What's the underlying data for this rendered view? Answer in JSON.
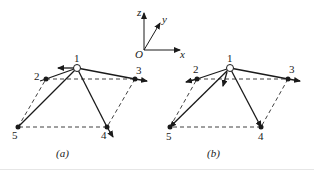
{
  "axes": {
    "origin_label": "O",
    "x_label": "x",
    "y_label": "y",
    "z_label": "z"
  },
  "figure_a": {
    "caption": "(a)",
    "nodes": [
      {
        "id": "1",
        "label": "1",
        "type": "open"
      },
      {
        "id": "2",
        "label": "2",
        "type": "filled"
      },
      {
        "id": "3",
        "label": "3",
        "type": "filled"
      },
      {
        "id": "4",
        "label": "4",
        "type": "filled"
      },
      {
        "id": "5",
        "label": "5",
        "type": "filled"
      }
    ],
    "members": [
      "1-2",
      "1-3",
      "1-4",
      "1-5"
    ],
    "dashed_outline": [
      "2-3",
      "3-4",
      "4-5",
      "5-2"
    ]
  },
  "figure_b": {
    "caption": "(b)",
    "nodes": [
      {
        "id": "1",
        "label": "1",
        "type": "open"
      },
      {
        "id": "2",
        "label": "2",
        "type": "filled"
      },
      {
        "id": "3",
        "label": "3",
        "type": "filled"
      },
      {
        "id": "4",
        "label": "4",
        "type": "filled"
      },
      {
        "id": "5",
        "label": "5",
        "type": "filled"
      }
    ],
    "members": [
      "1-2",
      "1-3",
      "1-4",
      "1-5"
    ],
    "dashed_outline": [
      "2-3",
      "3-4",
      "4-5",
      "5-2"
    ]
  },
  "colors": {
    "ink": "#1a1a1a",
    "background": "#ffffff"
  }
}
